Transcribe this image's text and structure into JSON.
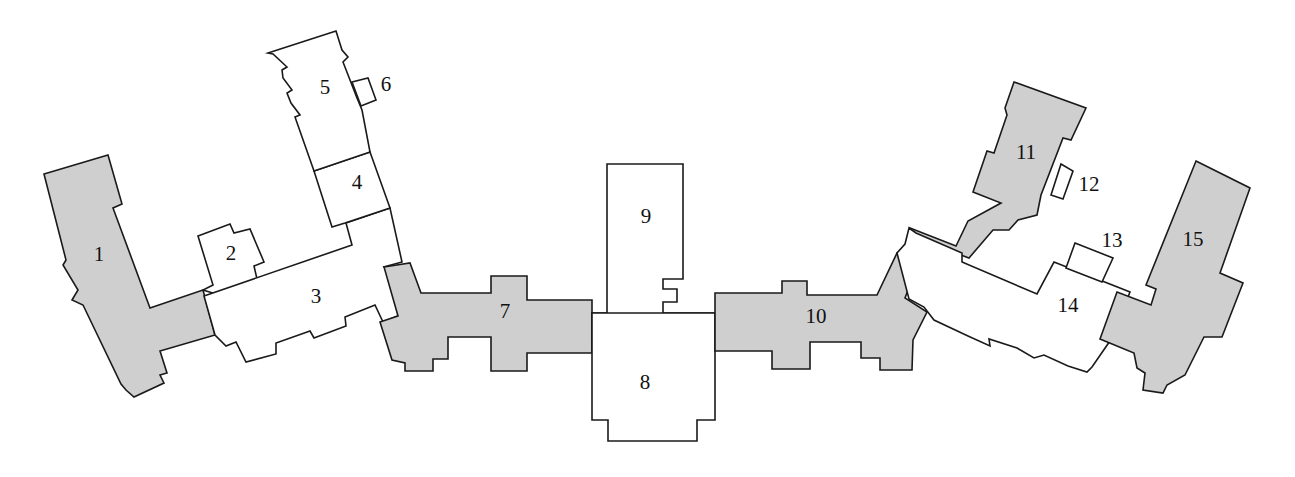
{
  "diagram": {
    "type": "floor-plan",
    "colors": {
      "shaded": "#cfcfcf",
      "plain": "#ffffff",
      "stroke": "#1a1a1a"
    },
    "rooms": [
      {
        "id": "1",
        "label": "1",
        "shaded": true
      },
      {
        "id": "2",
        "label": "2",
        "shaded": false
      },
      {
        "id": "3",
        "label": "3",
        "shaded": false
      },
      {
        "id": "4",
        "label": "4",
        "shaded": false
      },
      {
        "id": "5",
        "label": "5",
        "shaded": false
      },
      {
        "id": "6",
        "label": "6",
        "shaded": false
      },
      {
        "id": "7",
        "label": "7",
        "shaded": true
      },
      {
        "id": "8",
        "label": "8",
        "shaded": false
      },
      {
        "id": "9",
        "label": "9",
        "shaded": false
      },
      {
        "id": "10",
        "label": "10",
        "shaded": true
      },
      {
        "id": "11",
        "label": "11",
        "shaded": true
      },
      {
        "id": "12",
        "label": "12",
        "shaded": false
      },
      {
        "id": "13",
        "label": "13",
        "shaded": false
      },
      {
        "id": "14",
        "label": "14",
        "shaded": false
      },
      {
        "id": "15",
        "label": "15",
        "shaded": true
      }
    ]
  }
}
